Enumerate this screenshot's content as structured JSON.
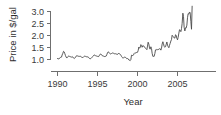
{
  "chart_data": {
    "type": "line",
    "title": "",
    "xlabel": "Year",
    "ylabel": "Price in $/gal",
    "xlim": [
      1990.0,
      2006.9
    ],
    "ylim": [
      0.85,
      3.3
    ],
    "grid": false,
    "legend": null,
    "xticks": [
      1990,
      1995,
      2000,
      2005
    ],
    "xtick_labels": [
      "1990",
      "1995",
      "2000",
      "2005"
    ],
    "yticks": [
      1.0,
      1.5,
      2.0,
      2.5,
      3.0
    ],
    "ytick_labels": [
      "1.0",
      "1.5",
      "2.0",
      "2.5",
      "3.0"
    ],
    "series": [
      {
        "name": "Price in $/gal",
        "color": "#4a4a4a",
        "x": [
          1990.0,
          1990.08,
          1990.17,
          1990.25,
          1990.33,
          1990.42,
          1990.5,
          1990.58,
          1990.67,
          1990.75,
          1990.83,
          1990.92,
          1991.0,
          1991.08,
          1991.17,
          1991.25,
          1991.33,
          1991.42,
          1991.5,
          1991.58,
          1991.67,
          1991.75,
          1991.83,
          1991.92,
          1992.0,
          1992.08,
          1992.17,
          1992.25,
          1992.33,
          1992.42,
          1992.5,
          1992.58,
          1992.67,
          1992.75,
          1992.83,
          1992.92,
          1993.0,
          1993.08,
          1993.17,
          1993.25,
          1993.33,
          1993.42,
          1993.5,
          1993.58,
          1993.67,
          1993.75,
          1993.83,
          1993.92,
          1994.0,
          1994.08,
          1994.17,
          1994.25,
          1994.33,
          1994.42,
          1994.5,
          1994.58,
          1994.67,
          1994.75,
          1994.83,
          1994.92,
          1995.0,
          1995.08,
          1995.17,
          1995.25,
          1995.33,
          1995.42,
          1995.5,
          1995.58,
          1995.67,
          1995.75,
          1995.83,
          1995.92,
          1996.0,
          1996.08,
          1996.17,
          1996.25,
          1996.33,
          1996.42,
          1996.5,
          1996.58,
          1996.67,
          1996.75,
          1996.83,
          1996.92,
          1997.0,
          1997.08,
          1997.17,
          1997.25,
          1997.33,
          1997.42,
          1997.5,
          1997.58,
          1997.67,
          1997.75,
          1997.83,
          1997.92,
          1998.0,
          1998.08,
          1998.17,
          1998.25,
          1998.33,
          1998.42,
          1998.5,
          1998.58,
          1998.67,
          1998.75,
          1998.83,
          1998.92,
          1999.0,
          1999.08,
          1999.17,
          1999.25,
          1999.33,
          1999.42,
          1999.5,
          1999.58,
          1999.67,
          1999.75,
          1999.83,
          1999.92,
          2000.0,
          2000.08,
          2000.17,
          2000.25,
          2000.33,
          2000.42,
          2000.5,
          2000.58,
          2000.67,
          2000.75,
          2000.83,
          2000.92,
          2001.0,
          2001.08,
          2001.17,
          2001.25,
          2001.33,
          2001.42,
          2001.5,
          2001.58,
          2001.67,
          2001.75,
          2001.83,
          2001.92,
          2002.0,
          2002.08,
          2002.17,
          2002.25,
          2002.33,
          2002.42,
          2002.5,
          2002.58,
          2002.67,
          2002.75,
          2002.83,
          2002.92,
          2003.0,
          2003.08,
          2003.17,
          2003.25,
          2003.33,
          2003.42,
          2003.5,
          2003.58,
          2003.67,
          2003.75,
          2003.83,
          2003.92,
          2004.0,
          2004.08,
          2004.17,
          2004.25,
          2004.33,
          2004.42,
          2004.5,
          2004.58,
          2004.67,
          2004.75,
          2004.83,
          2004.92,
          2005.0,
          2005.08,
          2005.17,
          2005.25,
          2005.33,
          2005.42,
          2005.5,
          2005.58,
          2005.67,
          2005.75,
          2005.83,
          2005.92,
          2006.0,
          2006.08,
          2006.17,
          2006.25,
          2006.33,
          2006.42,
          2006.5,
          2006.58,
          2006.67,
          2006.75,
          2006.83
        ],
        "y": [
          1.04,
          1.03,
          1.02,
          1.06,
          1.08,
          1.09,
          1.1,
          1.19,
          1.26,
          1.34,
          1.32,
          1.24,
          1.16,
          1.1,
          1.06,
          1.1,
          1.13,
          1.15,
          1.13,
          1.12,
          1.11,
          1.1,
          1.12,
          1.1,
          1.06,
          1.04,
          1.06,
          1.09,
          1.14,
          1.16,
          1.15,
          1.14,
          1.13,
          1.13,
          1.14,
          1.12,
          1.1,
          1.09,
          1.08,
          1.11,
          1.13,
          1.14,
          1.13,
          1.12,
          1.11,
          1.11,
          1.11,
          1.07,
          1.04,
          1.03,
          1.04,
          1.07,
          1.1,
          1.13,
          1.15,
          1.19,
          1.18,
          1.16,
          1.15,
          1.14,
          1.13,
          1.12,
          1.13,
          1.18,
          1.22,
          1.23,
          1.2,
          1.16,
          1.15,
          1.14,
          1.13,
          1.12,
          1.13,
          1.14,
          1.21,
          1.28,
          1.32,
          1.3,
          1.26,
          1.24,
          1.23,
          1.25,
          1.27,
          1.27,
          1.26,
          1.25,
          1.23,
          1.24,
          1.23,
          1.22,
          1.21,
          1.25,
          1.25,
          1.24,
          1.22,
          1.18,
          1.13,
          1.09,
          1.06,
          1.07,
          1.09,
          1.1,
          1.09,
          1.06,
          1.03,
          1.04,
          1.03,
          0.98,
          0.97,
          0.95,
          1.0,
          1.18,
          1.17,
          1.16,
          1.19,
          1.25,
          1.28,
          1.27,
          1.28,
          1.3,
          1.3,
          1.37,
          1.52,
          1.47,
          1.5,
          1.62,
          1.59,
          1.51,
          1.58,
          1.56,
          1.55,
          1.49,
          1.47,
          1.45,
          1.41,
          1.56,
          1.72,
          1.64,
          1.48,
          1.43,
          1.53,
          1.46,
          1.26,
          1.13,
          1.13,
          1.13,
          1.25,
          1.4,
          1.42,
          1.4,
          1.41,
          1.42,
          1.42,
          1.45,
          1.45,
          1.39,
          1.47,
          1.64,
          1.74,
          1.66,
          1.54,
          1.51,
          1.53,
          1.62,
          1.73,
          1.6,
          1.54,
          1.49,
          1.59,
          1.67,
          1.77,
          1.83,
          2.01,
          1.97,
          1.94,
          1.9,
          1.89,
          2.03,
          2.01,
          1.88,
          1.82,
          1.92,
          2.1,
          2.24,
          2.22,
          2.16,
          2.29,
          2.5,
          2.93,
          2.79,
          2.34,
          2.19,
          2.32,
          2.31,
          2.43,
          2.74,
          2.91,
          2.89,
          2.98,
          2.95,
          2.59,
          2.26,
          3.22
        ]
      }
    ]
  },
  "axes": {
    "ylabel": "Price in $/gal",
    "xlabel": "Year",
    "ytick_labels": [
      "3.0",
      "2.5",
      "2.0",
      "1.5",
      "1.0"
    ],
    "xtick_labels": [
      "1990",
      "1995",
      "2000",
      "2005"
    ]
  }
}
